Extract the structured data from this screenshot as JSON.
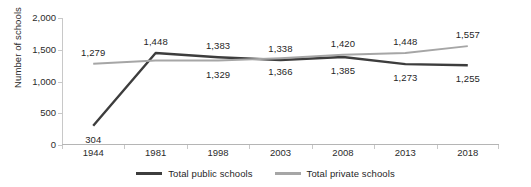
{
  "chart_data": {
    "type": "line",
    "title": "",
    "xlabel": "",
    "ylabel": "Number of schools",
    "categories": [
      "1944",
      "1981",
      "1998",
      "2003",
      "2008",
      "2013",
      "2018"
    ],
    "ylim": [
      0,
      2000
    ],
    "yticks": [
      "0",
      "500",
      "1,000",
      "1,500",
      "2,000"
    ],
    "ytick_values": [
      0,
      500,
      1000,
      1500,
      2000
    ],
    "grid": false,
    "legend_position": "bottom-center",
    "series": [
      {
        "name": "Total public schools",
        "color": "#3d3d3d",
        "values": [
          304,
          1448,
          1383,
          1338,
          1385,
          1273,
          1255
        ],
        "labels": [
          "304",
          "1,448",
          "1,383",
          "1,338",
          "1,385",
          "1,273",
          "1,255"
        ],
        "label_positions": [
          "below",
          "above",
          "above",
          "above",
          "below",
          "below",
          "below"
        ]
      },
      {
        "name": "Total private schools",
        "color": "#a6a6a6",
        "values": [
          1279,
          1329,
          1329,
          1366,
          1420,
          1448,
          1557
        ],
        "labels": [
          "1,279",
          "",
          "1,329",
          "1,366",
          "1,420",
          "1,448",
          "1,557"
        ],
        "label_positions": [
          "above",
          "none",
          "below",
          "below",
          "above",
          "above",
          "above"
        ]
      }
    ]
  },
  "legend": {
    "items": [
      {
        "label": "Total public schools",
        "color": "#3d3d3d"
      },
      {
        "label": "Total private schools",
        "color": "#a6a6a6"
      }
    ]
  }
}
